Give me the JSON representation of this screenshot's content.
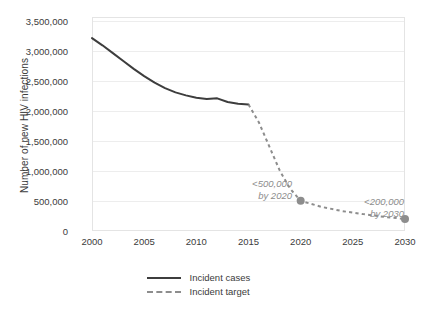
{
  "chart_data": {
    "type": "line",
    "title": "",
    "xlabel": "",
    "ylabel": "Number of new HIV infections",
    "xlim": [
      2000,
      2030
    ],
    "ylim": [
      0,
      3500000
    ],
    "grid": "horizontal",
    "legend_position": "bottom",
    "x_ticks": [
      "2000",
      "2005",
      "2010",
      "2015",
      "2020",
      "2025",
      "2030"
    ],
    "x_tick_values": [
      2000,
      2005,
      2010,
      2015,
      2020,
      2025,
      2030
    ],
    "y_ticks": [
      "0",
      "500,000",
      "1,000,000",
      "1,500,000",
      "2,000,000",
      "2,500,000",
      "3,000,000",
      "3,500,000"
    ],
    "y_tick_values": [
      0,
      500000,
      1000000,
      1500000,
      2000000,
      2500000,
      3000000,
      3500000
    ],
    "series": [
      {
        "name": "Incident cases",
        "style": "solid",
        "color": "#3d3d3d",
        "x": [
          2000,
          2001,
          2002,
          2003,
          2004,
          2005,
          2006,
          2007,
          2008,
          2009,
          2010,
          2011,
          2012,
          2013,
          2014,
          2015
        ],
        "values": [
          3200000,
          3080000,
          2950000,
          2820000,
          2690000,
          2570000,
          2460000,
          2370000,
          2300000,
          2250000,
          2210000,
          2190000,
          2200000,
          2140000,
          2110000,
          2100000
        ]
      },
      {
        "name": "Incident target",
        "style": "dashed",
        "color": "#8d8d8d",
        "x": [
          2015,
          2016,
          2017,
          2018,
          2019,
          2020,
          2022,
          2024,
          2026,
          2028,
          2030
        ],
        "values": [
          2100000,
          1800000,
          1400000,
          1000000,
          700000,
          500000,
          400000,
          330000,
          280000,
          235000,
          200000
        ],
        "markers": [
          {
            "x": 2020,
            "y": 500000
          },
          {
            "x": 2030,
            "y": 200000
          }
        ]
      }
    ],
    "annotations": [
      {
        "id": "target-2020",
        "line1": "<500,000",
        "line2": "by 2020",
        "x": 2020,
        "y": 500000
      },
      {
        "id": "target-2030",
        "line1": "<200,000",
        "line2": "by 2030",
        "x": 2030,
        "y": 200000
      }
    ],
    "legend": [
      {
        "label": "Incident cases",
        "style": "solid"
      },
      {
        "label": "Incident target",
        "style": "dashed"
      }
    ],
    "colors": {
      "incident_cases": "#3d3d3d",
      "incident_target": "#8d8d8d",
      "grid": "#ededed",
      "frame": "#e4e4e4",
      "text": "#3b3b3b",
      "annotation": "#8d8d8d",
      "background": "#ffffff"
    }
  }
}
